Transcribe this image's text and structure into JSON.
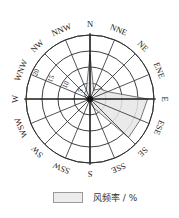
{
  "chart_data": {
    "type": "radar",
    "title": "",
    "directions": [
      "N",
      "NNE",
      "NE",
      "ENE",
      "E",
      "ESE",
      "SE",
      "SSE",
      "S",
      "SSW",
      "SW",
      "WSW",
      "W",
      "WNW",
      "NW",
      "NNW"
    ],
    "series": [
      {
        "name": "风频率 / %",
        "values": [
          14,
          3,
          4.5,
          6,
          18,
          17,
          17,
          3,
          1,
          1,
          1,
          1,
          1,
          1.5,
          2.5,
          3
        ]
      }
    ],
    "radial_ticks": [
      5,
      10,
      15,
      20
    ],
    "radial_tick_labels": [
      "5",
      "10",
      "15",
      "20"
    ],
    "radial_range": [
      0,
      20
    ],
    "radial_label_direction": "WNW",
    "grid": true,
    "legend_position": "bottom",
    "colors": {
      "fill": "#e6e6e6",
      "outline": "#555555",
      "grid": "#2a2a2a"
    }
  },
  "legend": {
    "label": "风频率 / %"
  }
}
